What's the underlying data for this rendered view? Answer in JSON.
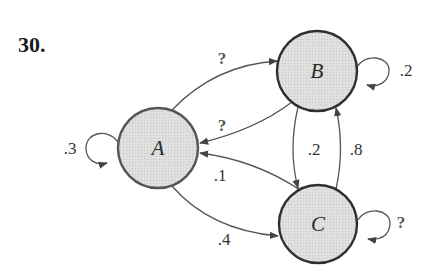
{
  "problem": {
    "number": "30."
  },
  "colors": {
    "node_fill": "#dcdcdc",
    "node_stroke": "#2f2f2f",
    "node_stroke_a": "#555555",
    "edge": "#555555",
    "text": "#333333"
  },
  "nodes": [
    {
      "id": "A",
      "label": "A",
      "cx": 158,
      "cy": 148,
      "r": 40
    },
    {
      "id": "B",
      "label": "B",
      "cx": 317,
      "cy": 71,
      "r": 40
    },
    {
      "id": "C",
      "label": "C",
      "cx": 318,
      "cy": 224,
      "r": 39
    }
  ],
  "edges": {
    "a_to_b": {
      "from": "A",
      "to": "B",
      "label": "?"
    },
    "b_to_a": {
      "from": "B",
      "to": "A",
      "label": "?"
    },
    "a_self": {
      "from": "A",
      "to": "A",
      "label": ".3"
    },
    "b_self": {
      "from": "B",
      "to": "B",
      "label": ".2"
    },
    "b_to_c": {
      "from": "B",
      "to": "C",
      "label": ".2"
    },
    "c_to_b": {
      "from": "C",
      "to": "B",
      "label": ".8"
    },
    "c_to_a": {
      "from": "C",
      "to": "A",
      "label": ".1"
    },
    "a_to_c": {
      "from": "A",
      "to": "C",
      "label": ".4"
    },
    "c_self": {
      "from": "C",
      "to": "C",
      "label": "?"
    }
  }
}
